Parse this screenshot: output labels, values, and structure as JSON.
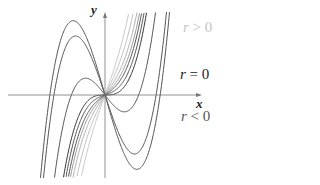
{
  "chart_data": {
    "type": "line",
    "title": "",
    "xlabel": "x",
    "ylabel": "y",
    "grid": false,
    "origin_px": [
      105,
      95
    ],
    "cubic_coefficient_px": 0.00115,
    "series": [
      {
        "name": "r < 0",
        "r": -3.5,
        "color": "#555555"
      },
      {
        "name": "r < 0",
        "r": -3.0,
        "color": "#555555"
      },
      {
        "name": "r < 0",
        "r": -1.3,
        "color": "#555555"
      },
      {
        "name": "r = 0",
        "r": 0.0,
        "color": "#333333"
      },
      {
        "name": "r > 0",
        "r": 0.35,
        "color": "#555555"
      },
      {
        "name": "r > 0",
        "r": 0.7,
        "color": "#555555"
      },
      {
        "name": "r > 0",
        "r": 1.0,
        "color": "#9a9a9a"
      },
      {
        "name": "r > 0",
        "r": 1.4,
        "color": "#b0b0b0"
      },
      {
        "name": "r > 0",
        "r": 2.0,
        "color": "#c0c0c0"
      },
      {
        "name": "r > 0",
        "r": 2.8,
        "color": "#c8c8c8"
      }
    ],
    "legend": [
      {
        "label": "r > 0",
        "color": "#c8c8c8"
      },
      {
        "label": "r = 0",
        "color": "#222222"
      },
      {
        "label": "r < 0",
        "color": "#555555"
      }
    ]
  },
  "labels": {
    "x_axis": "x",
    "y_axis": "y",
    "r_pos": {
      "var": "r",
      "op": " > ",
      "val": "0"
    },
    "r_zero": {
      "var": "r",
      "op": " = ",
      "val": "0"
    },
    "r_neg": {
      "var": "r",
      "op": " < ",
      "val": "0"
    }
  }
}
